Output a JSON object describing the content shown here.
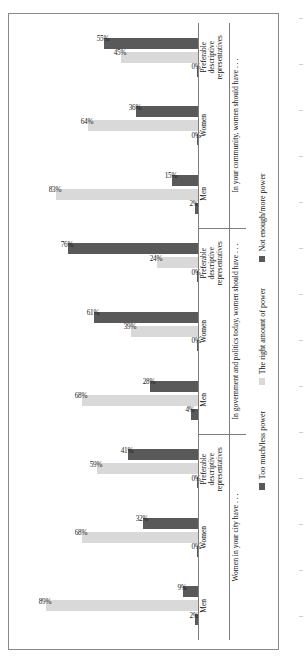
{
  "chart_data": {
    "type": "bar",
    "orientation": "horizontal",
    "title": "",
    "xlabel": "",
    "ylabel": "",
    "ylim": [
      0,
      100
    ],
    "grid": false,
    "legend_position": "bottom",
    "value_suffix": "%",
    "legend": [
      {
        "label": "Too much/less power",
        "color": "#595959"
      },
      {
        "label": "The right amount of power",
        "color": "#d9d9d9"
      },
      {
        "label": "Not enough/more power",
        "color": "#595959"
      }
    ],
    "series": [
      {
        "name": "Too much/less power",
        "color": "#595959"
      },
      {
        "name": "The right amount of power",
        "color": "#d9d9d9"
      },
      {
        "name": "Not enough/more power",
        "color": "#595959"
      }
    ],
    "groups": [
      {
        "question": "Women in your city have . . .",
        "categories": [
          {
            "label_lines": [
              "Men"
            ],
            "values": [
              2,
              89,
              9
            ]
          },
          {
            "label_lines": [
              "Women"
            ],
            "values": [
              0,
              68,
              32
            ]
          },
          {
            "label_lines": [
              "Preferable",
              "descriptive",
              "representatives"
            ],
            "values": [
              0,
              59,
              41
            ]
          }
        ]
      },
      {
        "question": "In government and politics today, women should have . . .",
        "categories": [
          {
            "label_lines": [
              "Men"
            ],
            "values": [
              4,
              68,
              28
            ]
          },
          {
            "label_lines": [
              "Women"
            ],
            "values": [
              0,
              39,
              61
            ]
          },
          {
            "label_lines": [
              "Preferable",
              "descriptive",
              "representatives"
            ],
            "values": [
              0,
              24,
              76
            ]
          }
        ]
      },
      {
        "question": "In your community, women should have . . .",
        "categories": [
          {
            "label_lines": [
              "Men"
            ],
            "values": [
              2,
              83,
              15
            ]
          },
          {
            "label_lines": [
              "Women"
            ],
            "values": [
              0,
              64,
              36
            ]
          },
          {
            "label_lines": [
              "Preferable",
              "descriptive",
              "representatives"
            ],
            "values": [
              0,
              45,
              55
            ]
          }
        ]
      }
    ]
  }
}
